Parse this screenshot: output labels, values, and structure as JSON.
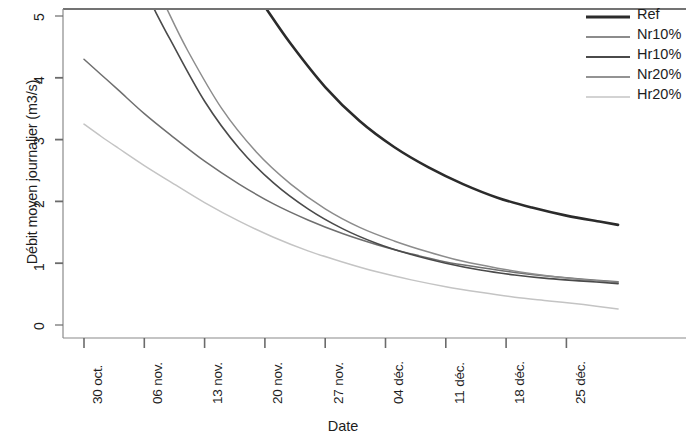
{
  "chart_data": {
    "type": "line",
    "title": "",
    "xlabel": "Date",
    "ylabel": "Débit moyen journalier (m3/s)",
    "x_tick_labels": [
      "30 oct.",
      "06 nov.",
      "13 nov.",
      "20 nov.",
      "27 nov.",
      "04 déc.",
      "11 déc.",
      "18 déc.",
      "25 déc."
    ],
    "y_tick_labels": [
      "0",
      "1",
      "2",
      "3",
      "4",
      "5"
    ],
    "y_ticks": [
      0,
      1,
      2,
      3,
      4,
      5
    ],
    "ylim": [
      0,
      5.15
    ],
    "grid": false,
    "legend_position": "top-right",
    "x_unit": "days from 30 oct.",
    "x_range_days": [
      0,
      62
    ],
    "series": [
      {
        "name": "Ref",
        "color": "#2b2b2b",
        "width": 2.6,
        "x": [
          21,
          24,
          28,
          32,
          36,
          40,
          44,
          48,
          52,
          56,
          60,
          62
        ],
        "values": [
          5.15,
          4.55,
          3.85,
          3.3,
          2.88,
          2.55,
          2.28,
          2.06,
          1.9,
          1.77,
          1.67,
          1.62
        ]
      },
      {
        "name": "Nr10%",
        "color": "#8c8c8c",
        "width": 1.5,
        "x": [
          9.5,
          12,
          16,
          20,
          24,
          28,
          32,
          36,
          40,
          44,
          48,
          52,
          56,
          60,
          62
        ],
        "values": [
          5.15,
          4.45,
          3.5,
          2.8,
          2.28,
          1.88,
          1.58,
          1.36,
          1.18,
          1.03,
          0.92,
          0.83,
          0.76,
          0.71,
          0.69
        ]
      },
      {
        "name": "Hr10%",
        "color": "#4a4a4a",
        "width": 1.6,
        "x": [
          8.0,
          10,
          14,
          18,
          22,
          26,
          30,
          34,
          38,
          42,
          46,
          50,
          54,
          58,
          62
        ],
        "values": [
          5.15,
          4.62,
          3.62,
          2.86,
          2.3,
          1.88,
          1.56,
          1.32,
          1.14,
          1.0,
          0.89,
          0.81,
          0.75,
          0.71,
          0.67
        ]
      },
      {
        "name": "Nr20%",
        "color": "#6f6f6f",
        "width": 1.5,
        "x": [
          0,
          2,
          4,
          7,
          10,
          14,
          18,
          22,
          26,
          30,
          34,
          38,
          42,
          46,
          50,
          54,
          58,
          62
        ],
        "values": [
          4.3,
          4.05,
          3.8,
          3.42,
          3.08,
          2.65,
          2.28,
          1.96,
          1.7,
          1.48,
          1.3,
          1.15,
          1.02,
          0.93,
          0.85,
          0.79,
          0.74,
          0.7
        ]
      },
      {
        "name": "Hr20%",
        "color": "#c4c4c4",
        "width": 1.5,
        "x": [
          0,
          2,
          4,
          7,
          10,
          14,
          18,
          22,
          26,
          30,
          34,
          38,
          42,
          46,
          50,
          54,
          58,
          62
        ],
        "values": [
          3.25,
          3.05,
          2.86,
          2.58,
          2.32,
          1.98,
          1.68,
          1.42,
          1.2,
          1.02,
          0.86,
          0.73,
          0.62,
          0.53,
          0.45,
          0.39,
          0.33,
          0.26
        ]
      }
    ]
  },
  "axes": {
    "x_title": "Date",
    "y_title": "Débit moyen journalier (m3/s)"
  },
  "legend": {
    "items": [
      {
        "label": "Ref"
      },
      {
        "label": "Nr10%"
      },
      {
        "label": "Hr10%"
      },
      {
        "label": "Nr20%"
      },
      {
        "label": "Hr20%"
      }
    ]
  },
  "y_labels": {
    "t0": "0",
    "t1": "1",
    "t2": "2",
    "t3": "3",
    "t4": "4",
    "t5": "5"
  },
  "x_labels": {
    "t0": "30 oct.",
    "t1": "06 nov.",
    "t2": "13 nov.",
    "t3": "20 nov.",
    "t4": "27 nov.",
    "t5": "04 déc.",
    "t6": "11 déc.",
    "t7": "18 déc.",
    "t8": "25 déc."
  }
}
